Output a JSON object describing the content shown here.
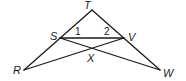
{
  "diagram": {
    "type": "geometry",
    "points": {
      "T": {
        "label": "T",
        "x": 92,
        "y": 10
      },
      "S": {
        "label": "S",
        "x": 60,
        "y": 38
      },
      "V": {
        "label": "V",
        "x": 124,
        "y": 38
      },
      "X": {
        "label": "X",
        "x": 92,
        "y": 49
      },
      "R": {
        "label": "R",
        "x": 24,
        "y": 70
      },
      "W": {
        "label": "W",
        "x": 160,
        "y": 70
      }
    },
    "segments": [
      "TR",
      "TW",
      "SV",
      "SW",
      "VR"
    ],
    "angle_labels": {
      "angle1": "1",
      "angle2": "2"
    }
  }
}
